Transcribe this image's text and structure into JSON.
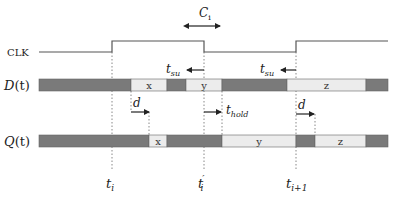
{
  "colors": {
    "dark": "#7a7a7a",
    "light": "#ececec",
    "line": "#555555",
    "text": "#222222"
  },
  "signals": {
    "clk": {
      "label": "CLK",
      "low_y": 52,
      "high_y": 41,
      "edges": [
        [
          39,
          52
        ],
        [
          112,
          52
        ],
        [
          112,
          41
        ],
        [
          204,
          41
        ],
        [
          204,
          52
        ],
        [
          296,
          52
        ],
        [
          296,
          41
        ],
        [
          388,
          41
        ]
      ]
    },
    "d": {
      "label_main": "D",
      "label_arg": "(t)",
      "y": 79,
      "h": 12,
      "segments": [
        {
          "x0": 39,
          "x1": 131,
          "type": "dark",
          "text": ""
        },
        {
          "x0": 131,
          "x1": 167,
          "type": "light",
          "text": "x"
        },
        {
          "x0": 167,
          "x1": 186,
          "type": "dark",
          "text": ""
        },
        {
          "x0": 186,
          "x1": 222,
          "type": "light",
          "text": "y"
        },
        {
          "x0": 222,
          "x1": 287,
          "type": "dark",
          "text": ""
        },
        {
          "x0": 287,
          "x1": 366,
          "type": "light",
          "text": "z"
        },
        {
          "x0": 366,
          "x1": 388,
          "type": "dark",
          "text": ""
        }
      ]
    },
    "q": {
      "label_main": "Q",
      "label_arg": "(t)",
      "y": 135,
      "h": 12,
      "segments": [
        {
          "x0": 39,
          "x1": 149,
          "type": "dark",
          "text": ""
        },
        {
          "x0": 149,
          "x1": 167,
          "type": "light",
          "text": "x"
        },
        {
          "x0": 167,
          "x1": 222,
          "type": "dark",
          "text": ""
        },
        {
          "x0": 222,
          "x1": 296,
          "type": "light",
          "text": "y"
        },
        {
          "x0": 296,
          "x1": 315,
          "type": "dark",
          "text": ""
        },
        {
          "x0": 315,
          "x1": 366,
          "type": "light",
          "text": "z"
        },
        {
          "x0": 366,
          "x1": 388,
          "type": "dark",
          "text": ""
        }
      ]
    }
  },
  "annotations": {
    "ci": {
      "label": "C",
      "sub": "i"
    },
    "tsu": {
      "label": "t",
      "sub": "su"
    },
    "thold": {
      "label": "t",
      "sub": "hold"
    },
    "d": {
      "label": "d"
    }
  },
  "time_markers": [
    {
      "x": 112,
      "label": "t",
      "sub": "i",
      "prime": ""
    },
    {
      "x": 204,
      "label": "t",
      "sub": "i",
      "prime": "′"
    },
    {
      "x": 296,
      "label": "t",
      "sub": "i+1",
      "prime": ""
    }
  ]
}
